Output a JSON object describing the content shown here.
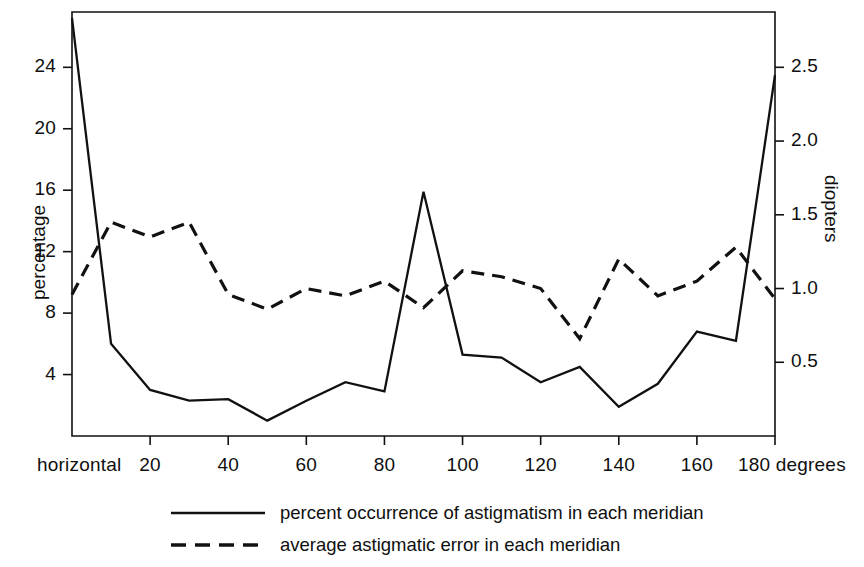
{
  "figure": {
    "background_color": "#ffffff",
    "line_color": "#111111"
  },
  "axes": {
    "left": {
      "label": "percentage",
      "ticks": [
        "4",
        "8",
        "12",
        "16",
        "20",
        "24"
      ],
      "tick_values": [
        4,
        8,
        12,
        16,
        20,
        24
      ],
      "range": [
        0,
        27.6
      ]
    },
    "right": {
      "label": "diopters",
      "ticks": [
        "0.5",
        "1.0",
        "1.5",
        "2.0",
        "2.5"
      ],
      "tick_values": [
        0.5,
        1.0,
        1.5,
        2.0,
        2.5
      ],
      "range": [
        0,
        2.875
      ]
    },
    "bottom": {
      "ticks": [
        "horizontal",
        "20",
        "40",
        "60",
        "80",
        "100",
        "120",
        "140",
        "160",
        "180 degrees"
      ],
      "tick_values": [
        0,
        20,
        40,
        60,
        80,
        100,
        120,
        140,
        160,
        180
      ],
      "range": [
        0,
        180
      ]
    }
  },
  "legend": {
    "entries": [
      {
        "label": "percent occurrence of astigmatism in each meridian",
        "style": "solid"
      },
      {
        "label": "average astigmatic error in each meridian",
        "style": "dashed"
      }
    ]
  },
  "chart_data": {
    "type": "line",
    "title": "",
    "xlabel": "degrees",
    "ylabel": "percentage",
    "y2label": "diopters",
    "xlim": [
      0,
      180
    ],
    "ylim": [
      0,
      27.6
    ],
    "y2lim": [
      0,
      2.875
    ],
    "grid": false,
    "legend_position": "bottom",
    "x": [
      0,
      10,
      20,
      30,
      40,
      50,
      60,
      70,
      80,
      90,
      100,
      110,
      120,
      130,
      140,
      150,
      160,
      170,
      180
    ],
    "series": [
      {
        "name": "percent occurrence of astigmatism in each meridian",
        "style": "solid",
        "axis": "left",
        "unit": "%",
        "values": [
          27.2,
          6.0,
          3.0,
          2.3,
          2.4,
          1.0,
          2.3,
          3.5,
          2.9,
          15.9,
          5.3,
          5.1,
          3.5,
          4.5,
          1.9,
          3.4,
          6.8,
          6.2,
          23.5
        ]
      },
      {
        "name": "average astigmatic error in each meridian",
        "style": "dashed",
        "axis": "right",
        "unit": "diopters",
        "values": [
          0.96,
          1.45,
          1.35,
          1.45,
          0.96,
          0.86,
          1.0,
          0.95,
          1.05,
          0.87,
          1.12,
          1.08,
          1.0,
          0.66,
          1.2,
          0.95,
          1.05,
          1.28,
          0.93
        ]
      }
    ]
  }
}
